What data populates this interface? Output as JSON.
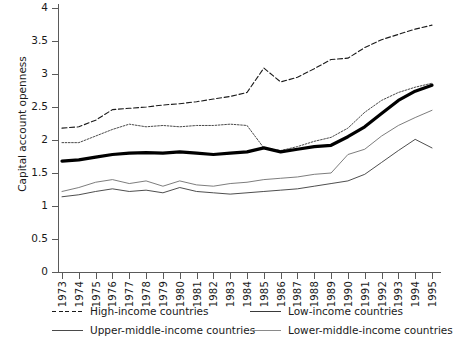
{
  "chart_data": {
    "type": "line",
    "title": "",
    "xlabel": "",
    "ylabel": "Capital account openness",
    "ylim": [
      0,
      4
    ],
    "ytick_step": 0.5,
    "yticks": [
      "0",
      "0.5",
      "1",
      "1.5",
      "2",
      "2.5",
      "3",
      "3.5",
      "4"
    ],
    "grid": false,
    "legend_position": "bottom",
    "x": [
      1973,
      1974,
      1975,
      1976,
      1977,
      1978,
      1979,
      1980,
      1981,
      1982,
      1983,
      1984,
      1985,
      1986,
      1987,
      1988,
      1989,
      1990,
      1991,
      1992,
      1993,
      1994,
      1995
    ],
    "categories": [
      "1973",
      "1974",
      "1975",
      "1976",
      "1977",
      "1978",
      "1979",
      "1980",
      "1981",
      "1982",
      "1983",
      "1984",
      "1985",
      "1986",
      "1987",
      "1988",
      "1989",
      "1990",
      "1991",
      "1992",
      "1993",
      "1994",
      "1995"
    ],
    "series": [
      {
        "name": "High-income countries",
        "style": "dashed",
        "color": "#1a1a1a",
        "width": 1.1,
        "values": [
          2.18,
          2.2,
          2.3,
          2.46,
          2.48,
          2.5,
          2.53,
          2.55,
          2.58,
          2.62,
          2.66,
          2.72,
          3.09,
          2.88,
          2.95,
          3.08,
          3.22,
          3.24,
          3.4,
          3.52,
          3.6,
          3.68,
          3.74
        ]
      },
      {
        "name": "Low-income countries",
        "style": "solid",
        "color": "#3a3a3a",
        "width": 0.9,
        "values": [
          1.14,
          1.17,
          1.22,
          1.26,
          1.22,
          1.24,
          1.2,
          1.28,
          1.22,
          1.2,
          1.18,
          1.2,
          1.22,
          1.24,
          1.26,
          1.3,
          1.34,
          1.38,
          1.48,
          1.66,
          1.84,
          2.01,
          1.88
        ]
      },
      {
        "name": "Upper-middle-income countries",
        "style": "dotted",
        "color": "#4a4a4a",
        "width": 1.0,
        "values": [
          1.96,
          1.96,
          2.06,
          2.16,
          2.24,
          2.2,
          2.22,
          2.2,
          2.22,
          2.22,
          2.24,
          2.22,
          1.88,
          1.84,
          1.9,
          1.98,
          2.04,
          2.18,
          2.42,
          2.6,
          2.72,
          2.8,
          2.86
        ]
      },
      {
        "name": "Lower-middle-income countries",
        "style": "solid",
        "color": "#6e6e6e",
        "width": 0.9,
        "values": [
          1.22,
          1.28,
          1.36,
          1.4,
          1.34,
          1.38,
          1.3,
          1.38,
          1.32,
          1.3,
          1.34,
          1.36,
          1.4,
          1.42,
          1.44,
          1.48,
          1.5,
          1.78,
          1.86,
          2.06,
          2.22,
          2.34,
          2.45
        ]
      },
      {
        "name": "All countries (bold)",
        "style": "bold-solid",
        "color": "#000000",
        "width": 3.2,
        "values": [
          1.68,
          1.7,
          1.74,
          1.78,
          1.8,
          1.81,
          1.8,
          1.82,
          1.8,
          1.78,
          1.8,
          1.82,
          1.88,
          1.82,
          1.86,
          1.9,
          1.92,
          2.05,
          2.2,
          2.4,
          2.6,
          2.74,
          2.83
        ]
      }
    ]
  },
  "legend": {
    "items": [
      {
        "label": "High-income countries",
        "style": "dashed"
      },
      {
        "label": "Low-income countries",
        "style": "solid-dark"
      },
      {
        "label": "Upper-middle-income countries",
        "style": "solid-mid"
      },
      {
        "label": "Lower-middle-income countries",
        "style": "solid-light"
      }
    ]
  }
}
